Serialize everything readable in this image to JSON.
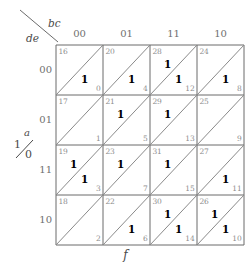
{
  "labels": {
    "corner_top": "bc",
    "corner_bottom": "de",
    "left_var": "a",
    "left_high": "1",
    "left_low": "0",
    "bottom_function": "f"
  },
  "colors": {
    "grid_line": "#6b6b6b",
    "diagonal_line": "#8a8a8a",
    "index_text": "#8d8d8d",
    "label_text": "#6f6f6f",
    "one_text": "#000000",
    "background": "#ffffff"
  },
  "chart_data": {
    "type": "table",
    "title": "",
    "map_kind": "karnaugh-map",
    "variables": [
      "a",
      "b",
      "c",
      "d",
      "e"
    ],
    "function_name": "f",
    "column_variable": "bc",
    "row_variable": "de",
    "split_variable": "a",
    "split_upper_value": "1",
    "split_lower_value": "0",
    "column_headers": [
      "00",
      "01",
      "11",
      "10"
    ],
    "row_headers": [
      "00",
      "01",
      "11",
      "10"
    ],
    "cells": [
      [
        {
          "upper_index": "16",
          "lower_index": "0",
          "upper_one": false,
          "lower_one": true
        },
        {
          "upper_index": "20",
          "lower_index": "4",
          "upper_one": false,
          "lower_one": true
        },
        {
          "upper_index": "28",
          "lower_index": "12",
          "upper_one": true,
          "lower_one": true
        },
        {
          "upper_index": "24",
          "lower_index": "8",
          "upper_one": false,
          "lower_one": true
        }
      ],
      [
        {
          "upper_index": "17",
          "lower_index": "1",
          "upper_one": false,
          "lower_one": false
        },
        {
          "upper_index": "21",
          "lower_index": "5",
          "upper_one": true,
          "lower_one": false
        },
        {
          "upper_index": "29",
          "lower_index": "13",
          "upper_one": true,
          "lower_one": false
        },
        {
          "upper_index": "25",
          "lower_index": "9",
          "upper_one": false,
          "lower_one": false
        }
      ],
      [
        {
          "upper_index": "19",
          "lower_index": "3",
          "upper_one": true,
          "lower_one": true
        },
        {
          "upper_index": "23",
          "lower_index": "7",
          "upper_one": true,
          "lower_one": false
        },
        {
          "upper_index": "31",
          "lower_index": "15",
          "upper_one": true,
          "lower_one": false
        },
        {
          "upper_index": "27",
          "lower_index": "11",
          "upper_one": false,
          "lower_one": true
        }
      ],
      [
        {
          "upper_index": "18",
          "lower_index": "2",
          "upper_one": false,
          "lower_one": false
        },
        {
          "upper_index": "22",
          "lower_index": "6",
          "upper_one": false,
          "lower_one": true
        },
        {
          "upper_index": "30",
          "lower_index": "14",
          "upper_one": true,
          "lower_one": true
        },
        {
          "upper_index": "26",
          "lower_index": "10",
          "upper_one": true,
          "lower_one": true
        }
      ]
    ],
    "minterms_one": [
      0,
      4,
      12,
      8,
      28,
      21,
      29,
      19,
      3,
      23,
      31,
      11,
      6,
      30,
      14,
      26,
      10
    ],
    "one_cell_value": "1"
  }
}
